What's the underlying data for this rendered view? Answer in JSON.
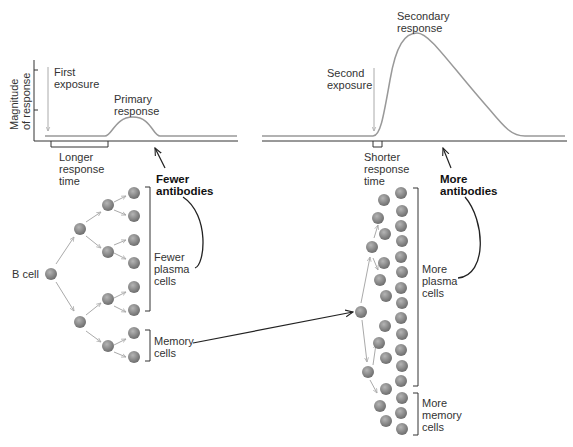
{
  "graph": {
    "y_axis_label": "Magnitude\nof response",
    "left": {
      "exposure_label": "First\nexposure",
      "peak_label": "Primary\nresponse",
      "response_time_label": "Longer\nresponse\ntime",
      "antibody_label": "Fewer\nantibodies"
    },
    "right": {
      "exposure_label": "Second\nexposure",
      "peak_label": "Secondary\nresponse",
      "response_time_label": "Shorter\nresponse\ntime",
      "antibody_label": "More\nantibodies"
    }
  },
  "cells": {
    "origin_label": "B cell",
    "left_plasma_label": "Fewer\nplasma\ncells",
    "left_memory_label": "Memory\ncells",
    "right_plasma_label": "More\nplasma\ncells",
    "right_memory_label": "More\nmemory\ncells"
  },
  "colors": {
    "curve": "#999999",
    "axis": "#333333",
    "cell": "#8a8a8a",
    "arrow": "#aaaaaa"
  }
}
